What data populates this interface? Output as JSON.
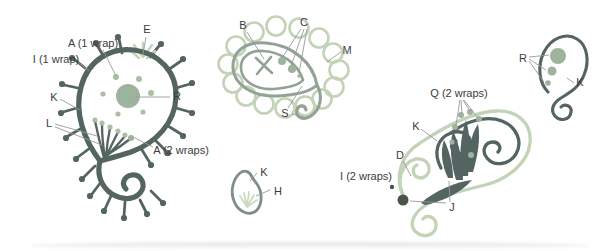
{
  "diagram": {
    "colors": {
      "background": "#ffffff",
      "dark_outline": "#546460",
      "medium_outline": "#92a295",
      "teardrop_outline": "#7f8f86",
      "pale_green": "#c2d3b8",
      "sage": "#9eb39c",
      "sage_light": "#abbfa6",
      "dark_knot": "#4d524e",
      "leader_line": "#999999",
      "label_text": "#3c3c3c"
    },
    "labels": [
      {
        "id": "E",
        "text": "E",
        "x": 147,
        "y": 33,
        "lines": [
          [
            146,
            37,
            143,
            54
          ]
        ]
      },
      {
        "id": "A1",
        "text": "A (1 wrap)",
        "x": 93,
        "y": 47,
        "lines": [
          [
            103,
            50,
            116,
            76
          ]
        ]
      },
      {
        "id": "I1",
        "text": "I (1 wrap)",
        "x": 56,
        "y": 63,
        "lines": [
          [
            78,
            62,
            89,
            71
          ]
        ]
      },
      {
        "id": "K-left",
        "text": "K",
        "x": 54,
        "y": 101,
        "lines": [
          [
            60,
            99,
            80,
            110
          ]
        ]
      },
      {
        "id": "L",
        "text": "L",
        "x": 49,
        "y": 127,
        "lines": [
          [
            55,
            124,
            97,
            136
          ],
          [
            55,
            127,
            102,
            145
          ]
        ]
      },
      {
        "id": "R-left",
        "text": "R",
        "x": 177,
        "y": 100,
        "lines": [
          [
            170,
            97,
            135,
            97
          ]
        ]
      },
      {
        "id": "A2",
        "text": "A (2 wraps)",
        "x": 181,
        "y": 154,
        "lines": [
          [
            153,
            147,
            133,
            137
          ]
        ]
      },
      {
        "id": "B",
        "text": "B",
        "x": 243,
        "y": 29,
        "lines": [
          [
            247,
            32,
            264,
            59
          ]
        ]
      },
      {
        "id": "C",
        "text": "C",
        "x": 304,
        "y": 26,
        "lines": [
          [
            301,
            29,
            282,
            58
          ],
          [
            304,
            29,
            291,
            66
          ],
          [
            307,
            29,
            299,
            73
          ]
        ]
      },
      {
        "id": "M",
        "text": "M",
        "x": 347,
        "y": 54,
        "lines": [
          [
            341,
            52,
            327,
            62
          ]
        ]
      },
      {
        "id": "S",
        "text": "S",
        "x": 285,
        "y": 117,
        "lines": [
          [
            288,
            108,
            302,
            86
          ],
          [
            292,
            114,
            304,
            117
          ]
        ]
      },
      {
        "id": "K-tear",
        "text": "K",
        "x": 264,
        "y": 176,
        "lines": [
          [
            257,
            173,
            250,
            181
          ]
        ]
      },
      {
        "id": "H",
        "text": "H",
        "x": 278,
        "y": 195,
        "lines": [
          [
            270,
            190,
            256,
            196
          ]
        ]
      },
      {
        "id": "Q",
        "text": "Q (2 wraps)",
        "x": 459,
        "y": 97,
        "lines": [
          [
            460,
            100,
            456,
            125
          ],
          [
            461,
            100,
            462,
            114
          ],
          [
            463,
            100,
            470,
            111
          ],
          [
            464,
            100,
            478,
            118
          ]
        ]
      },
      {
        "id": "K-right",
        "text": "K",
        "x": 416,
        "y": 130,
        "lines": [
          [
            421,
            129,
            437,
            141
          ]
        ]
      },
      {
        "id": "D",
        "text": "D",
        "x": 400,
        "y": 159,
        "lines": [
          [
            403,
            161,
            411,
            176
          ]
        ]
      },
      {
        "id": "I2",
        "text": "I (2 wraps)",
        "x": 366,
        "y": 180,
        "lines": []
      },
      {
        "id": "J",
        "text": "J",
        "x": 452,
        "y": 211,
        "lines": [
          [
            450,
            202,
            449,
            181
          ],
          [
            446,
            203,
            410,
            201
          ]
        ]
      },
      {
        "id": "R-right",
        "text": "R",
        "x": 523,
        "y": 62,
        "lines": [
          [
            529,
            57,
            549,
            55
          ],
          [
            529,
            59,
            546,
            70
          ],
          [
            529,
            61,
            544,
            82
          ]
        ]
      },
      {
        "id": "K-small",
        "text": "K",
        "x": 580,
        "y": 86,
        "lines": [
          [
            574,
            83,
            567,
            78
          ]
        ]
      }
    ]
  }
}
